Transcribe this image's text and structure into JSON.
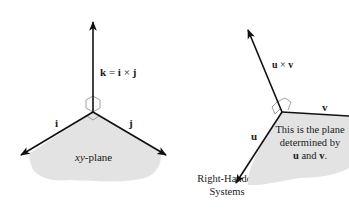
{
  "left_diagram": {
    "k_label": {
      "lhs": "k",
      "eq": " = ",
      "a": "i",
      "op": " × ",
      "b": "j"
    },
    "i_label": "i",
    "j_label": "j",
    "plane_label": {
      "xy": "xy",
      "rest": "-plane"
    }
  },
  "center_caption": {
    "line1": "Right-Handed",
    "line2": "Systems"
  },
  "right_diagram": {
    "cross_label": {
      "a": "u",
      "op": " × ",
      "b": "v"
    },
    "u_label": "u",
    "v_label": "v",
    "plane_text": {
      "line1": "This is the plane",
      "line2": "determined by",
      "line3_a": "u",
      "line3_mid": " and ",
      "line3_b": "v",
      "line3_end": "."
    }
  },
  "colors": {
    "plane_fill": "#e3e3e3",
    "vector": "#111111",
    "right_angle_marker": "#888888"
  }
}
